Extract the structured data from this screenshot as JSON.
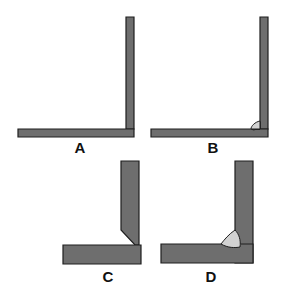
{
  "diagram": {
    "type": "weld-joint-illustrations",
    "colors": {
      "plate_fill": "#6e6e6e",
      "plate_outline": "#1e1e1e",
      "weld_fill": "#d2d2d2",
      "background": "#ffffff"
    },
    "panels": [
      {
        "id": "A",
        "label": "A",
        "description": "Thin plates forming a corner joint, no weld"
      },
      {
        "id": "B",
        "label": "B",
        "description": "Thin plates forming a corner joint with a small fillet weld"
      },
      {
        "id": "C",
        "label": "C",
        "description": "Thick plates with chamfered (beveled) vertical plate edge, no weld"
      },
      {
        "id": "D",
        "label": "D",
        "description": "Thick plates forming a corner joint with a fillet weld"
      }
    ]
  }
}
